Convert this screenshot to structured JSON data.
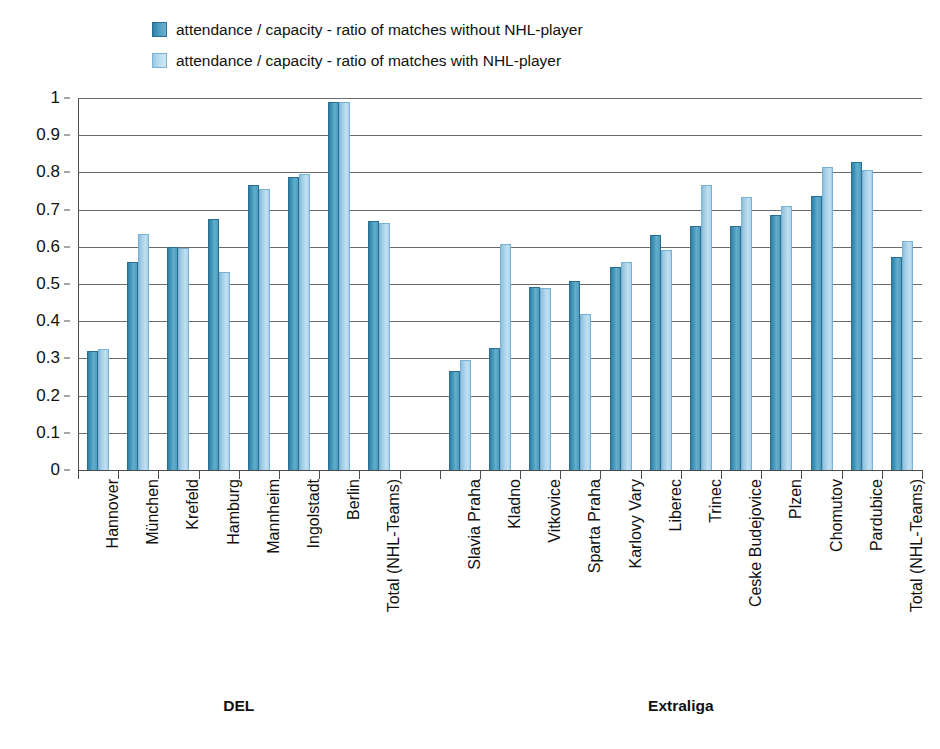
{
  "legend": {
    "position": "top-left",
    "items": [
      {
        "label": "attendance / capacity - ratio of matches without NHL-player",
        "color": "#3f93b8",
        "swatch": "dark"
      },
      {
        "label": "attendance / capacity - ratio of matches with NHL-player",
        "color": "#a4cfe6",
        "swatch": "light"
      }
    ]
  },
  "axis": {
    "y_ticks": [
      "0",
      "0.1",
      "0.2",
      "0.3",
      "0.4",
      "0.5",
      "0.6",
      "0.7",
      "0.8",
      "0.9",
      "1"
    ],
    "y_min": 0,
    "y_max": 1,
    "y_step": 0.1,
    "grid": true
  },
  "group_titles": [
    {
      "label": "DEL"
    },
    {
      "label": "Extraliga"
    }
  ],
  "chart_data": {
    "type": "bar",
    "title": "",
    "xlabel": "",
    "ylabel": "",
    "ylim": [
      0,
      1
    ],
    "ytick_step": 0.1,
    "grid": true,
    "legend_position": "top-left",
    "groups": [
      "DEL",
      "Extraliga"
    ],
    "categories": [
      "Hannover",
      "München",
      "Krefeld",
      "Hamburg",
      "Mannheim",
      "Ingolstadt",
      "Berlin",
      "Total (NHL-Teams)",
      "Slavia Praha",
      "Kladno",
      "Vitkovice",
      "Sparta Praha",
      "Karlovy Vary",
      "Liberec",
      "Trinec",
      "Ceske Budejovice",
      "Plzen",
      "Chomutov",
      "Pardubice",
      "Total (NHL-Teams)"
    ],
    "category_groups": [
      "DEL",
      "DEL",
      "DEL",
      "DEL",
      "DEL",
      "DEL",
      "DEL",
      "DEL",
      "Extraliga",
      "Extraliga",
      "Extraliga",
      "Extraliga",
      "Extraliga",
      "Extraliga",
      "Extraliga",
      "Extraliga",
      "Extraliga",
      "Extraliga",
      "Extraliga",
      "Extraliga"
    ],
    "series": [
      {
        "name": "attendance / capacity - ratio of matches without NHL-player",
        "color": "#3f93b8",
        "values": [
          0.32,
          0.56,
          0.6,
          0.675,
          0.765,
          0.787,
          0.99,
          0.67,
          0.265,
          0.327,
          0.492,
          0.508,
          0.545,
          0.632,
          0.657,
          0.657,
          0.685,
          0.737,
          0.828,
          0.572
        ]
      },
      {
        "name": "attendance / capacity - ratio of matches with NHL-player",
        "color": "#a4cfe6",
        "values": [
          0.325,
          0.635,
          0.597,
          0.532,
          0.755,
          0.795,
          0.99,
          0.663,
          0.297,
          0.608,
          0.49,
          0.42,
          0.56,
          0.592,
          0.767,
          0.733,
          0.71,
          0.815,
          0.807,
          0.615
        ]
      }
    ]
  }
}
